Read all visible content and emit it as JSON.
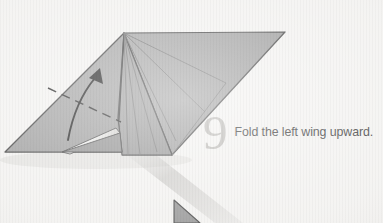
{
  "page": {
    "background_color": "#f2f1ef",
    "width": 383,
    "height": 223
  },
  "instruction": {
    "step_number": "9",
    "step_number_color": "#b6b4b0",
    "text": "Fold the left wing upward.",
    "text_color": "#2e2e2e"
  },
  "diagram": {
    "type": "origami-fold-step",
    "paper_fill": "#9b9b9b",
    "paper_fill_light": "#a8a8a8",
    "paper_fill_dark": "#8e8e8e",
    "paper_fill_darker": "#858585",
    "outline_color": "#3a3a3a",
    "crease_color": "#555555",
    "fold_line_color": "#1d1d1d",
    "arrow_color": "#111111",
    "highlight_color": "#f4f3f1",
    "shadow_color": "rgba(120,118,114,0.30)",
    "arc_color": "rgba(186,184,180,0.55)",
    "labels": {
      "apex": "apex-point",
      "left_wing": "left-wing-panel",
      "right_wing": "right-wing-panel",
      "body": "body-panel",
      "fold_line": "valley-fold-dashed-line",
      "arrow": "fold-direction-arrow",
      "next_step_peek": "next-step-figure-peek"
    }
  }
}
